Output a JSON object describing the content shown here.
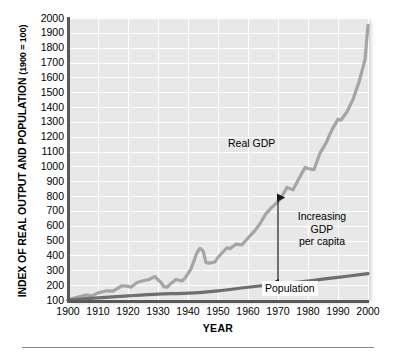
{
  "chart_data": {
    "type": "line",
    "title": "",
    "xlabel": "YEAR",
    "ylabel": "INDEX OF REAL OUTPUT AND POPULATION (1900 = 100)",
    "ylabel_main": "INDEX OF REAL OUTPUT AND POPULATION",
    "ylabel_paren": "(1900 = 100)",
    "xlim": [
      1900,
      2000
    ],
    "ylim": [
      100,
      2000
    ],
    "grid": true,
    "legend_position": "inline-annotations",
    "yticks": [
      2000,
      1900,
      1800,
      1700,
      1600,
      1500,
      1400,
      1300,
      1200,
      1100,
      1000,
      900,
      800,
      700,
      600,
      500,
      400,
      300,
      200,
      100
    ],
    "xticks": [
      1900,
      1910,
      1920,
      1930,
      1940,
      1950,
      1960,
      1970,
      1980,
      1990,
      2000
    ],
    "series": [
      {
        "name": "Real GDP",
        "color": "#a5a5a5",
        "x": [
          1900,
          1903,
          1906,
          1908,
          1910,
          1913,
          1915,
          1918,
          1920,
          1921,
          1923,
          1925,
          1927,
          1929,
          1930,
          1931,
          1932,
          1933,
          1934,
          1936,
          1938,
          1939,
          1941,
          1943,
          1944,
          1945,
          1946,
          1947,
          1949,
          1950,
          1953,
          1954,
          1956,
          1958,
          1960,
          1962,
          1964,
          1966,
          1968,
          1970,
          1971,
          1973,
          1975,
          1977,
          1979,
          1980,
          1982,
          1984,
          1986,
          1988,
          1990,
          1991,
          1993,
          1995,
          1997,
          1999,
          2000
        ],
        "y": [
          100,
          118,
          134,
          128,
          148,
          162,
          160,
          196,
          192,
          186,
          218,
          230,
          238,
          258,
          236,
          218,
          188,
          186,
          206,
          238,
          228,
          248,
          310,
          420,
          448,
          432,
          352,
          348,
          356,
          388,
          452,
          446,
          476,
          472,
          518,
          560,
          614,
          682,
          726,
          762,
          788,
          858,
          842,
          918,
          992,
          986,
          978,
          1090,
          1158,
          1248,
          1318,
          1312,
          1368,
          1452,
          1568,
          1720,
          1950
        ],
        "note": "Index 1900 = 100; jagged with Great Depression trough ~1933 and WWII peak ~1944, post-war dip, then sustained growth"
      },
      {
        "name": "Population",
        "color": "#6e6e6e",
        "x": [
          1900,
          1910,
          1920,
          1930,
          1940,
          1950,
          1960,
          1970,
          1980,
          1990,
          2000
        ],
        "y": [
          100,
          114,
          128,
          140,
          146,
          162,
          186,
          208,
          228,
          252,
          278
        ],
        "note": "Smooth steadily rising curve from 100 to roughly 280-350 on the index"
      }
    ],
    "annotations": [
      {
        "id": "gdp",
        "text": "Real GDP",
        "x": 1955,
        "y": 1250
      },
      {
        "id": "per_capita",
        "text": "Increasing GDP per capita",
        "line1": "Increasing",
        "line2": "GDP",
        "line3": "per capita",
        "x": 1976,
        "y": 620
      },
      {
        "id": "population",
        "text": "Population",
        "x": 1966,
        "y": 155
      },
      {
        "id": "arrow",
        "text": "",
        "x": 1970,
        "y_top": 790,
        "y_bottom": 215,
        "style": "double-headed vertical arrow"
      }
    ]
  },
  "colors": {
    "plot_background": "#e8e8e8",
    "gridline": "#ffffff",
    "axis": "#595959",
    "gdp_line": "#a5a5a5",
    "population_line": "#6e6e6e",
    "text": "#000000",
    "rule": "#8a8a8a"
  }
}
